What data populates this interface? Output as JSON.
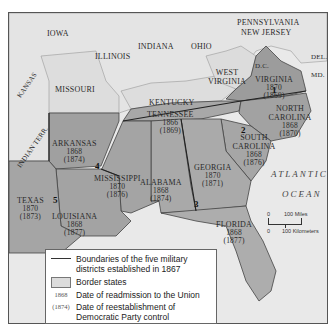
{
  "map": {
    "title": "Reconstruction military districts",
    "states_former_confederate": [
      {
        "name": "VIRGINIA",
        "readmitted": "1870",
        "democratic_control": "(1869)"
      },
      {
        "name": "NORTH CAROLINA",
        "readmitted": "1868",
        "democratic_control": "(1870)"
      },
      {
        "name": "SOUTH CAROLINA",
        "readmitted": "1868",
        "democratic_control": "(1876)"
      },
      {
        "name": "GEORGIA",
        "readmitted": "1870",
        "democratic_control": "(1871)"
      },
      {
        "name": "FLORIDA",
        "readmitted": "1868",
        "democratic_control": "(1877)"
      },
      {
        "name": "ALABAMA",
        "readmitted": "1868",
        "democratic_control": "(1874)"
      },
      {
        "name": "MISSISSIPPI",
        "readmitted": "1870",
        "democratic_control": "(1876)"
      },
      {
        "name": "LOUISIANA",
        "readmitted": "1868",
        "democratic_control": "(1877)"
      },
      {
        "name": "ARKANSAS",
        "readmitted": "1868",
        "democratic_control": "(1874)"
      },
      {
        "name": "TEXAS",
        "readmitted": "1870",
        "democratic_control": "(1873)"
      },
      {
        "name": "TENNESSEE",
        "readmitted": "1866",
        "democratic_control": "(1869)"
      }
    ],
    "other_labels": {
      "iowa": "IOWA",
      "illinois": "ILLINOIS",
      "indiana": "INDIANA",
      "ohio": "OHIO",
      "pennsylvania": "PENNSYLVANIA",
      "new_jersey": "NEW JERSEY",
      "missouri": "MISSOURI",
      "kansas": "KANSAS",
      "indian_terr": "INDIAN TERR.",
      "kentucky": "KENTUCKY",
      "west_virginia": "WEST VIRGINIA",
      "dc": "D.C.",
      "del": "DEL.",
      "md": "MD."
    },
    "districts": [
      "1",
      "2",
      "3",
      "4",
      "5"
    ],
    "ocean": {
      "line1": "ATLANTIC",
      "line2": "OCEAN"
    },
    "scale": {
      "zero_top": "0",
      "miles": "100 Miles",
      "zero_bottom": "0",
      "km": "100 Kilometers"
    }
  },
  "legend": {
    "items": [
      {
        "key": "line",
        "label": "Boundaries of the five military districts established in 1867"
      },
      {
        "key": "box",
        "label": "Border states"
      },
      {
        "key": "1868",
        "label": "Date of readmission to the Union"
      },
      {
        "key": "(1874)",
        "label": "Date of reestablishment of Democratic Party control"
      }
    ]
  },
  "colors": {
    "confederate_fill": "#9a9a9a",
    "border_state_fill": "#dcdcdc",
    "ocean": "#e8e8e8",
    "district_line": "#333333"
  }
}
